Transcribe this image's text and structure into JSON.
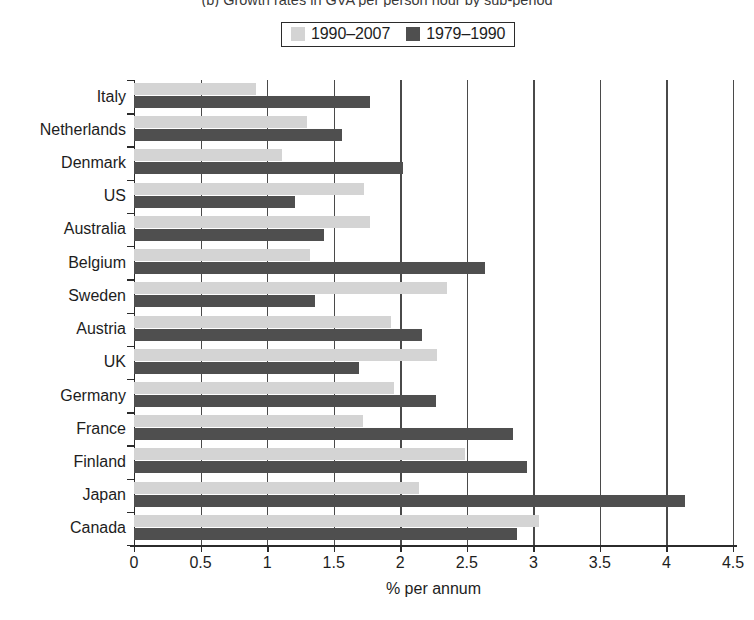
{
  "chart_data": {
    "type": "bar",
    "orientation": "horizontal",
    "title": "(b) Growth rates in GVA per person hour by sub-period",
    "xlabel": "% per annum",
    "ylabel": "",
    "xlim": [
      0,
      4.5
    ],
    "xticks": [
      "0",
      "0.5",
      "1",
      "1.5",
      "2",
      "2.5",
      "3",
      "3.5",
      "4",
      "4.5"
    ],
    "xtick_values": [
      0,
      0.5,
      1,
      1.5,
      2,
      2.5,
      3,
      3.5,
      4,
      4.5
    ],
    "grid": "vertical",
    "legend_position": "top-center",
    "categories": [
      "Italy",
      "Netherlands",
      "Denmark",
      "US",
      "Australia",
      "Belgium",
      "Sweden",
      "Austria",
      "UK",
      "Germany",
      "France",
      "Finland",
      "Japan",
      "Canada"
    ],
    "series": [
      {
        "name": "1990–2007",
        "color": "#d4d4d4",
        "values": [
          0.92,
          1.3,
          1.11,
          1.73,
          1.77,
          1.32,
          2.35,
          1.93,
          2.28,
          1.95,
          1.72,
          2.49,
          2.14,
          3.04
        ]
      },
      {
        "name": "1979–1990",
        "color": "#4f4f4f",
        "values": [
          1.77,
          1.56,
          2.02,
          1.21,
          1.43,
          2.64,
          1.36,
          2.16,
          1.69,
          2.27,
          2.85,
          2.95,
          4.14,
          2.88
        ]
      }
    ]
  },
  "legend": {
    "items": [
      {
        "label": "1990–2007",
        "swatch": "light-gray-swatch"
      },
      {
        "label": "1979–1990",
        "swatch": "dark-gray-swatch"
      }
    ]
  },
  "colors": {
    "series_1990_2007": "#d4d4d4",
    "series_1979_1990": "#4f4f4f",
    "axis": "#2b2b2b",
    "grid": "#4a4a4a",
    "background": "#ffffff"
  }
}
